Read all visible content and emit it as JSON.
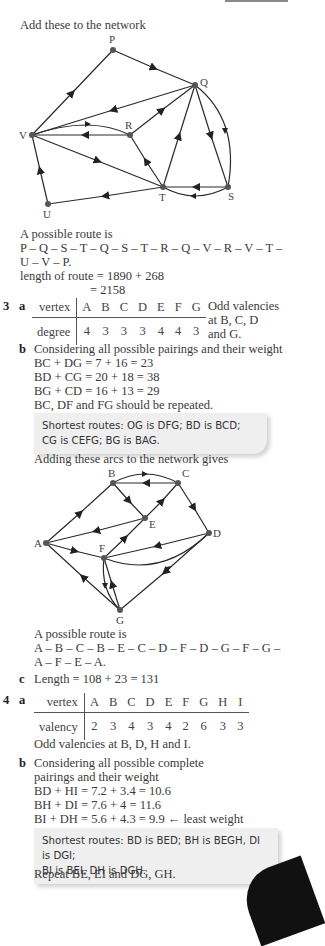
{
  "page": {
    "intro": "Add these to the network",
    "graph1": {
      "nodes": [
        "P",
        "Q",
        "R",
        "V",
        "T",
        "S",
        "U"
      ]
    },
    "q2_route_intro": "A possible route is",
    "q2_route_line1": "P – Q – S – T – Q – S – T – R – Q – V – R – V – T –",
    "q2_route_line2": "U – V – P.",
    "q2_length_line1": "length of route = 1890 + 268",
    "q2_length_line2": "= 2158",
    "q3": {
      "number": "3",
      "part_a": "a",
      "table": {
        "row1_header": "vertex",
        "row1": [
          "A",
          "B",
          "C",
          "D",
          "E",
          "F",
          "G"
        ],
        "row2_header": "degree",
        "row2": [
          "4",
          "3",
          "3",
          "3",
          "4",
          "4",
          "3"
        ]
      },
      "odd_note_line1": "Odd valencies",
      "odd_note_line2": "at B, C, D",
      "odd_note_line3": "and G.",
      "part_b": "b",
      "b_intro": "Considering all possible pairings and their weight",
      "pairings": [
        "BC + DG = 7 + 16 = 23",
        "BD + CG = 20 + 18 = 38",
        "BG + CD = 16 + 13 = 29"
      ],
      "repeat": "BC, DF and FG should be repeated.",
      "note_line1": "Shortest routes: OG is DFG; BD is BCD;",
      "note_line2": "CG is CEFG; BG is BAG.",
      "adding": "Adding these arcs to the network gives",
      "graph2": {
        "nodes": [
          "A",
          "B",
          "C",
          "D",
          "E",
          "F",
          "G"
        ]
      },
      "route_intro": "A possible route is",
      "route_line1": "A – B – C – B – E – C – D – F – D – G – F – G –",
      "route_line2": "A – F – E – A.",
      "part_c": "c",
      "length": "Length = 108 + 23 = 131"
    },
    "q4": {
      "number": "4",
      "part_a": "a",
      "table": {
        "row1_header": "vertex",
        "row1": [
          "A",
          "B",
          "C",
          "D",
          "E",
          "F",
          "G",
          "H",
          "I"
        ],
        "row2_header": "valency",
        "row2": [
          "2",
          "3",
          "4",
          "3",
          "4",
          "2",
          "6",
          "3",
          "3"
        ]
      },
      "odd_note": "Odd valencies at B, D, H and I.",
      "part_b": "b",
      "b_intro_line1": "Considering all possible complete",
      "b_intro_line2": "pairings and their weight",
      "pairings": [
        "BD + HI = 7.2 + 3.4 = 10.6",
        "BH + DI = 7.6 + 4 = 11.6",
        "BI + DH = 5.6 + 4.3 = 9.9 ← least weight"
      ],
      "note_line1": "Shortest routes: BD is BED; BH is BEGH, DI is DGI;",
      "note_line2": "BI is BEI, DH is DGH.",
      "repeat": "Repeat BE, EI and DG, GH."
    }
  }
}
